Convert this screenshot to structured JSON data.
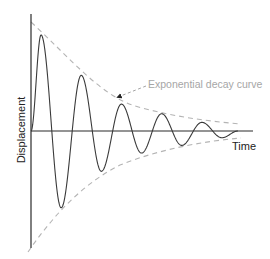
{
  "diagram": {
    "x_axis_label": "Time",
    "y_axis_label": "Displacement",
    "annotation": "Exponential decay curve",
    "colors": {
      "axis": "#2b2b2b",
      "wave": "#3a3a3a",
      "envelope": "#b4b4b4",
      "annotation_text": "#a6a6a6"
    }
  },
  "chart_data": {
    "type": "line",
    "title": "",
    "xlabel": "Time",
    "ylabel": "Displacement",
    "grid": false,
    "series": [
      {
        "name": "Damped oscillation",
        "style": "solid",
        "extrema": [
          {
            "t": 0.25,
            "value": 1.0
          },
          {
            "t": 0.75,
            "value": -0.8
          },
          {
            "t": 1.25,
            "value": 0.58
          },
          {
            "t": 1.75,
            "value": -0.42
          },
          {
            "t": 2.25,
            "value": 0.28
          },
          {
            "t": 2.75,
            "value": -0.23
          },
          {
            "t": 3.25,
            "value": 0.18
          },
          {
            "t": 3.75,
            "value": -0.15
          },
          {
            "t": 4.25,
            "value": 0.09
          },
          {
            "t": 4.75,
            "value": -0.07
          }
        ]
      },
      {
        "name": "Exponential decay curve (upper)",
        "style": "dashed"
      },
      {
        "name": "Exponential decay curve (lower)",
        "style": "dashed"
      }
    ],
    "annotations": [
      "Exponential decay curve"
    ]
  }
}
